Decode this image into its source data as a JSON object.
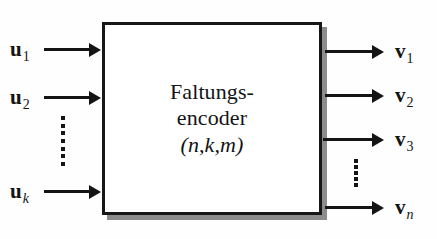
{
  "diagram": {
    "box": {
      "line1": "Faltungs-",
      "line2": "encoder",
      "params": "(n,k,m)",
      "border_color": "#171717",
      "fill_color": "#ffffff",
      "shadow_color": "#8c8c8c"
    },
    "background_color": "#fefefe",
    "stroke_color": "#141414",
    "inputs": [
      {
        "symbol": "u",
        "subscript": "1",
        "subscript_italic": false
      },
      {
        "symbol": "u",
        "subscript": "2",
        "subscript_italic": false
      },
      {
        "symbol": "u",
        "subscript": "k",
        "subscript_italic": true
      }
    ],
    "outputs": [
      {
        "symbol": "v",
        "subscript": "1",
        "subscript_italic": false
      },
      {
        "symbol": "v",
        "subscript": "2",
        "subscript_italic": false
      },
      {
        "symbol": "v",
        "subscript": "3",
        "subscript_italic": false
      },
      {
        "symbol": "v",
        "subscript": "n",
        "subscript_italic": true
      }
    ],
    "ellipsis": {
      "left_dot_count": 7,
      "right_dot_count": 5
    }
  }
}
